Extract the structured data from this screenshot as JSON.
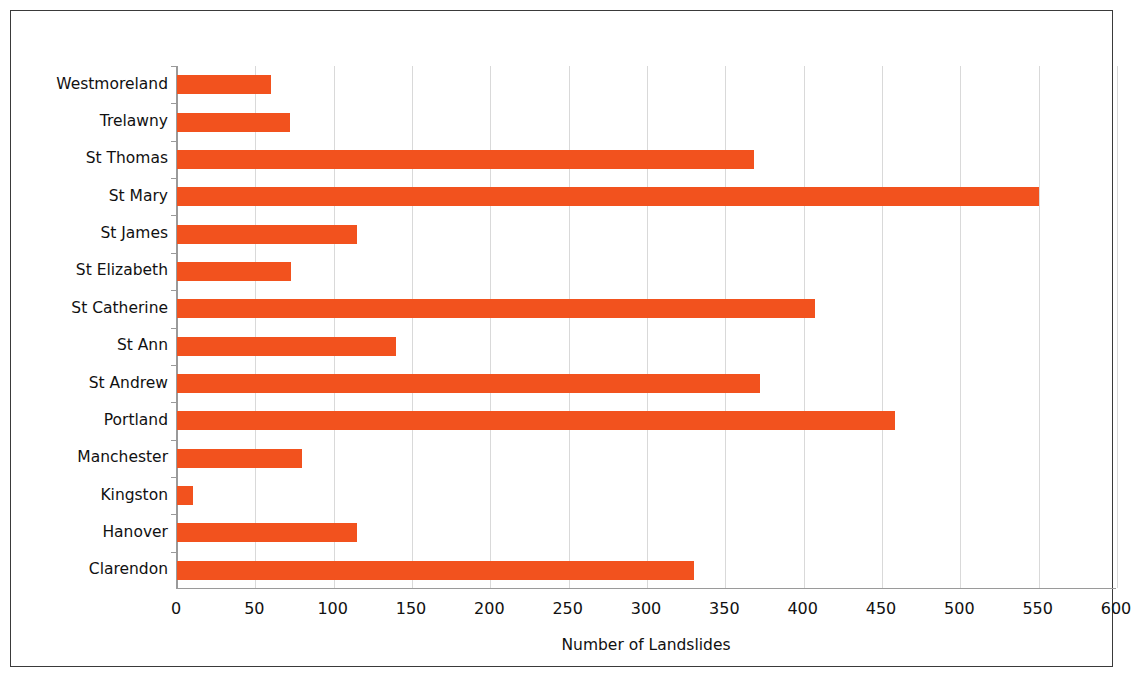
{
  "chart_data": {
    "type": "bar",
    "orientation": "horizontal",
    "title": "",
    "xlabel": "Number of Landslides",
    "ylabel": "",
    "xlim": [
      0,
      600
    ],
    "xticks": [
      0,
      50,
      100,
      150,
      200,
      250,
      300,
      350,
      400,
      450,
      500,
      550,
      600
    ],
    "xtick_labels": [
      "0",
      "50",
      "100",
      "150",
      "200",
      "250",
      "300",
      "350",
      "400",
      "450",
      "500",
      "550",
      "600"
    ],
    "grid": "vertical",
    "legend": null,
    "bar_color": "#F2521E",
    "categories": [
      "Westmoreland",
      "Trelawny",
      "St Thomas",
      "St Mary",
      "St James",
      "St Elizabeth",
      "St Catherine",
      "St Ann",
      "St Andrew",
      "Portland",
      "Manchester",
      "Kingston",
      "Hanover",
      "Clarendon"
    ],
    "values": [
      60,
      72,
      368,
      550,
      115,
      73,
      407,
      140,
      372,
      458,
      80,
      10,
      115,
      330
    ],
    "series": [
      {
        "name": "Number of Landslides",
        "values": [
          60,
          72,
          368,
          550,
          115,
          73,
          407,
          140,
          372,
          458,
          80,
          10,
          115,
          330
        ]
      }
    ]
  },
  "colors": {
    "bar": "#F2521E",
    "gridline": "#d9d9d9",
    "axis": "#9a9a9a",
    "frame": "#3a3a3a",
    "text": "#111111",
    "background": "#ffffff"
  }
}
